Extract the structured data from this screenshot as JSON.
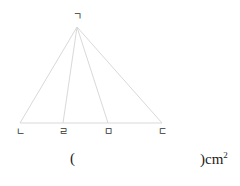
{
  "figure": {
    "type": "triangle-with-cevians",
    "apex_label": "ㄱ",
    "base_labels": [
      "ㄴ",
      "ㄹ",
      "ㅁ",
      "ㄷ"
    ],
    "line_color": "#d9d9d9"
  },
  "answer": {
    "open_paren": "(",
    "close_paren": ")",
    "unit": "cm",
    "unit_exponent": "2"
  }
}
